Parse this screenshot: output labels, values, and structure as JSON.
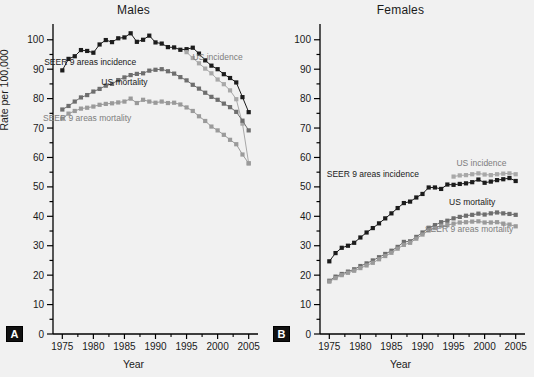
{
  "figure": {
    "ylabel": "Rate per 100,000",
    "xlabel": "Year",
    "panel_a_tag": "A",
    "panel_b_tag": "B",
    "panel_a_title": "Males",
    "panel_b_title": "Females"
  },
  "colors": {
    "seer_incidence": "#1c1c1c",
    "us_incidence": "#a8a8a8",
    "us_mortality": "#6e6e6e",
    "seer_mortality": "#9a9a9a",
    "axis": "#000000",
    "background": "#f1f1f1",
    "text": "#1a1a1a"
  },
  "chart_data": [
    {
      "type": "line",
      "title": "Males",
      "panel": "A",
      "xlabel": "Year",
      "ylabel": "Rate per 100,000",
      "xlim": [
        1973.5,
        2006.5
      ],
      "ylim": [
        0,
        104
      ],
      "xticks": [
        1975,
        1980,
        1985,
        1990,
        1995,
        2000,
        2005
      ],
      "yticks": [
        0,
        10,
        20,
        30,
        40,
        50,
        60,
        70,
        80,
        90,
        100
      ],
      "minor_ytick_step": 5,
      "grid": false,
      "legend": "inline-annotations",
      "x": [
        1975,
        1976,
        1977,
        1978,
        1979,
        1980,
        1981,
        1982,
        1983,
        1984,
        1985,
        1986,
        1987,
        1988,
        1989,
        1990,
        1991,
        1992,
        1993,
        1994,
        1995,
        1996,
        1997,
        1998,
        1999,
        2000,
        2001,
        2002,
        2003,
        2004,
        2005
      ],
      "series": [
        {
          "name": "SEER 9 areas incidence",
          "color": "#1c1c1c",
          "label_x": 1979.5,
          "label_y": 91.5,
          "values": [
            89.6,
            93.5,
            94.4,
            96.5,
            96.2,
            95.6,
            98.4,
            99.9,
            99.2,
            100.5,
            100.8,
            102.2,
            99.3,
            100.0,
            101.4,
            99.1,
            98.7,
            97.5,
            97.4,
            96.6,
            96.8,
            97.3,
            95.3,
            93.0,
            91.2,
            90.0,
            88.3,
            87.0,
            85.5,
            80.5,
            75.4
          ]
        },
        {
          "name": "US incidence",
          "color": "#a8a8a8",
          "label_x": 2000.0,
          "label_y": 93.0,
          "values": [
            null,
            null,
            null,
            null,
            null,
            null,
            null,
            null,
            null,
            null,
            null,
            null,
            null,
            null,
            null,
            null,
            null,
            null,
            null,
            null,
            95.8,
            93.8,
            92.0,
            90.2,
            88.6,
            86.5,
            84.9,
            82.8,
            79.8,
            71.5,
            58.0
          ]
        },
        {
          "name": "US mortality",
          "color": "#6e6e6e",
          "label_x": 1985.0,
          "label_y": 84.5,
          "values": [
            76.3,
            77.5,
            79.0,
            80.4,
            81.2,
            82.4,
            83.3,
            84.4,
            85.0,
            86.3,
            87.2,
            88.0,
            88.4,
            88.6,
            89.5,
            89.8,
            90.0,
            89.3,
            88.5,
            87.3,
            86.2,
            84.7,
            83.4,
            82.0,
            80.6,
            79.6,
            78.3,
            77.1,
            75.5,
            72.5,
            69.2
          ]
        },
        {
          "name": "SEER 9 areas mortality",
          "color": "#9a9a9a",
          "label_x": 1979.0,
          "label_y": 72.5,
          "values": [
            73.2,
            74.9,
            75.8,
            76.6,
            76.9,
            77.3,
            77.9,
            78.2,
            78.4,
            78.7,
            79.0,
            80.0,
            78.5,
            79.6,
            79.0,
            78.6,
            79.0,
            78.5,
            78.6,
            78.0,
            77.0,
            75.8,
            74.0,
            72.4,
            70.5,
            69.2,
            67.7,
            66.0,
            64.5,
            61.0,
            58.0
          ]
        }
      ]
    },
    {
      "type": "line",
      "title": "Females",
      "panel": "B",
      "xlabel": "Year",
      "ylabel": "Rate per 100,000",
      "xlim": [
        1973.5,
        2006.5
      ],
      "ylim": [
        0,
        104
      ],
      "xticks": [
        1975,
        1980,
        1985,
        1990,
        1995,
        2000,
        2005
      ],
      "yticks": [
        0,
        10,
        20,
        30,
        40,
        50,
        60,
        70,
        80,
        90,
        100
      ],
      "minor_ytick_step": 5,
      "grid": false,
      "legend": "inline-annotations",
      "x": [
        1975,
        1976,
        1977,
        1978,
        1979,
        1980,
        1981,
        1982,
        1983,
        1984,
        1985,
        1986,
        1987,
        1988,
        1989,
        1990,
        1991,
        1992,
        1993,
        1994,
        1995,
        1996,
        1997,
        1998,
        1999,
        2000,
        2001,
        2002,
        2003,
        2004,
        2005
      ],
      "series": [
        {
          "name": "SEER 9 areas incidence",
          "color": "#1c1c1c",
          "label_x": 1982.0,
          "label_y": 53.5,
          "values": [
            24.7,
            27.5,
            29.3,
            30.0,
            31.0,
            32.8,
            34.5,
            36.0,
            37.6,
            39.3,
            41.0,
            42.8,
            44.5,
            45.0,
            46.4,
            47.6,
            49.8,
            49.8,
            49.3,
            50.8,
            50.7,
            51.0,
            51.2,
            51.6,
            52.5,
            51.4,
            51.8,
            52.3,
            52.6,
            53.0,
            52.0
          ]
        },
        {
          "name": "US incidence",
          "color": "#a8a8a8",
          "label_x": 1999.5,
          "label_y": 57.0,
          "values": [
            null,
            null,
            null,
            null,
            null,
            null,
            null,
            null,
            null,
            null,
            null,
            null,
            null,
            null,
            null,
            null,
            null,
            null,
            null,
            null,
            53.5,
            53.9,
            54.0,
            54.3,
            54.6,
            54.2,
            54.0,
            54.3,
            54.5,
            54.6,
            54.3
          ]
        },
        {
          "name": "US mortality",
          "color": "#6e6e6e",
          "label_x": 1998.0,
          "label_y": 44.0,
          "values": [
            18.1,
            19.5,
            20.4,
            21.2,
            22.0,
            23.1,
            24.0,
            25.0,
            26.1,
            27.2,
            28.3,
            29.6,
            31.3,
            31.5,
            33.0,
            34.5,
            36.1,
            37.0,
            38.0,
            38.5,
            39.3,
            39.8,
            40.2,
            40.5,
            40.9,
            40.6,
            41.0,
            41.3,
            41.0,
            40.8,
            40.5
          ]
        },
        {
          "name": "SEER 9 areas mortality",
          "color": "#9a9a9a",
          "label_x": 1997.5,
          "label_y": 34.8,
          "values": [
            17.8,
            19.0,
            20.0,
            20.8,
            21.5,
            22.4,
            23.3,
            24.2,
            25.4,
            26.5,
            27.6,
            29.0,
            30.3,
            31.0,
            32.4,
            33.8,
            35.2,
            36.0,
            36.8,
            37.0,
            37.5,
            37.9,
            38.0,
            38.2,
            38.3,
            37.9,
            37.9,
            38.0,
            37.5,
            37.2,
            36.6
          ]
        }
      ]
    }
  ]
}
